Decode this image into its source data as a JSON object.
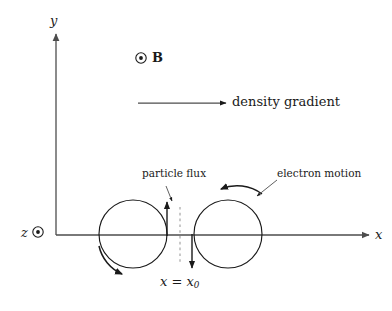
{
  "figure": {
    "background_color": "#ffffff",
    "line_color": "#4d4d4d",
    "text_color": "#1a1a1a",
    "width": 392,
    "height": 311
  },
  "axes": {
    "y_label": "y",
    "x_label": "x",
    "z_label": "z",
    "z_icon": "circle-dot-out-of-page-icon",
    "origin": {
      "x": 56,
      "y": 235
    }
  },
  "magnetic_field": {
    "icon": "circle-dot-out-of-page-icon",
    "label": "B",
    "direction": "out of page"
  },
  "gradient_arrow": {
    "label": "density gradient",
    "from_x": 138,
    "to_x": 226,
    "y": 103,
    "direction": "+x"
  },
  "annotations": {
    "particle_flux": {
      "label": "particle flux",
      "leader_from": {
        "x": 166,
        "y": 186
      },
      "leader_to": {
        "x": 172,
        "y": 200
      }
    },
    "electron_motion": {
      "label": "electron motion",
      "leader_from": {
        "x": 276,
        "y": 180
      },
      "leader_to": {
        "x": 256,
        "y": 196
      }
    },
    "position_marker": {
      "label_x": "x",
      "label_equals": " = ",
      "label_x0": "x",
      "label_subscript": "0",
      "full_label": "x = x0",
      "dashed_line_x": 180,
      "dashed_from_y": 207,
      "dashed_to_y": 262
    }
  },
  "orbits": [
    {
      "name": "left-electron-orbit",
      "cx": 133,
      "cy": 234,
      "r": 34,
      "rotation_arrow": "counter-clockwise-lower-left"
    },
    {
      "name": "right-electron-orbit",
      "cx": 228,
      "cy": 234,
      "r": 34,
      "rotation_arrow": "counter-clockwise-top"
    }
  ],
  "flux_arrows": [
    {
      "name": "up-flux-arrow",
      "x": 167,
      "from_y": 236,
      "to_y": 202,
      "direction": "up"
    },
    {
      "name": "down-flux-arrow",
      "x": 192,
      "from_y": 234,
      "to_y": 268,
      "direction": "down"
    }
  ]
}
